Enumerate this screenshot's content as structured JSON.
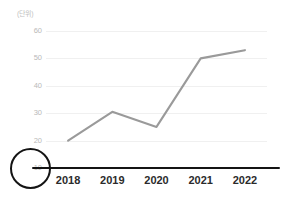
{
  "axis": {
    "unit_label": "(단위)",
    "y_ticks": [
      "60",
      "50",
      "40",
      "30",
      "20",
      "10"
    ],
    "x_ticks": [
      "2018",
      "2019",
      "2020",
      "2021",
      "2022"
    ]
  },
  "annotation": {
    "highlight_tick": "10",
    "highlight_color": "#141414"
  },
  "style": {
    "line_color": "#9a9a9a",
    "gridline_color": "#f0f0f0",
    "ytick_color": "#b9b9b9",
    "xtick_color": "#2b2b2b",
    "unit_color": "#c2c2c2",
    "background": "#ffffff"
  },
  "chart_data": {
    "type": "line",
    "title": "",
    "subtitle": "",
    "xlabel": "",
    "ylabel": "(단위)",
    "categories": [
      "2018",
      "2019",
      "2020",
      "2021",
      "2022"
    ],
    "values": [
      20,
      30.5,
      25,
      50,
      53
    ],
    "series": [
      {
        "name": "series-1",
        "values": [
          20,
          30.5,
          25,
          50,
          53
        ],
        "color": "#9a9a9a"
      }
    ],
    "ylim": [
      10,
      60
    ],
    "y_ticks": [
      60,
      50,
      40,
      30,
      20,
      10
    ],
    "x_tick_labels": [
      "2018",
      "2019",
      "2020",
      "2021",
      "2022"
    ],
    "grid": "horizontal-only",
    "legend": "none",
    "markers": "none",
    "annotations": [
      {
        "kind": "ellipse-highlight",
        "target": "y-axis tick 10",
        "color": "#141414"
      },
      {
        "kind": "emphasized-baseline",
        "target": "x-axis at y=10",
        "color": "#141414"
      }
    ]
  }
}
